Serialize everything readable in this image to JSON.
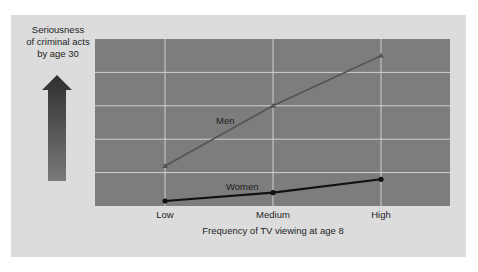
{
  "chart_data": {
    "type": "line",
    "title": "",
    "xlabel": "Frequency of TV viewing at age 8",
    "ylabel": "Seriousness of criminal acts by age 30",
    "ylabel_lines": [
      "Seriousness",
      "of criminal acts",
      "by age 30"
    ],
    "categories": [
      "Low",
      "Medium",
      "High"
    ],
    "series": [
      {
        "name": "Men",
        "values": [
          1.2,
          3.0,
          4.5
        ],
        "color": "#555555",
        "marker": "triangle"
      },
      {
        "name": "Women",
        "values": [
          0.15,
          0.4,
          0.8
        ],
        "color": "#111111",
        "marker": "circle"
      }
    ],
    "ylim": [
      0,
      5
    ],
    "y_ticks_labeled": false,
    "grid": true,
    "legend": "inline labels"
  },
  "colors": {
    "panel_bg": "#dcdcdc",
    "plot_bg": "#7d7d7d",
    "grid": "#d0d0d0",
    "arrow_top": "#2e2e2e",
    "arrow_bottom": "#7a7a7a"
  }
}
